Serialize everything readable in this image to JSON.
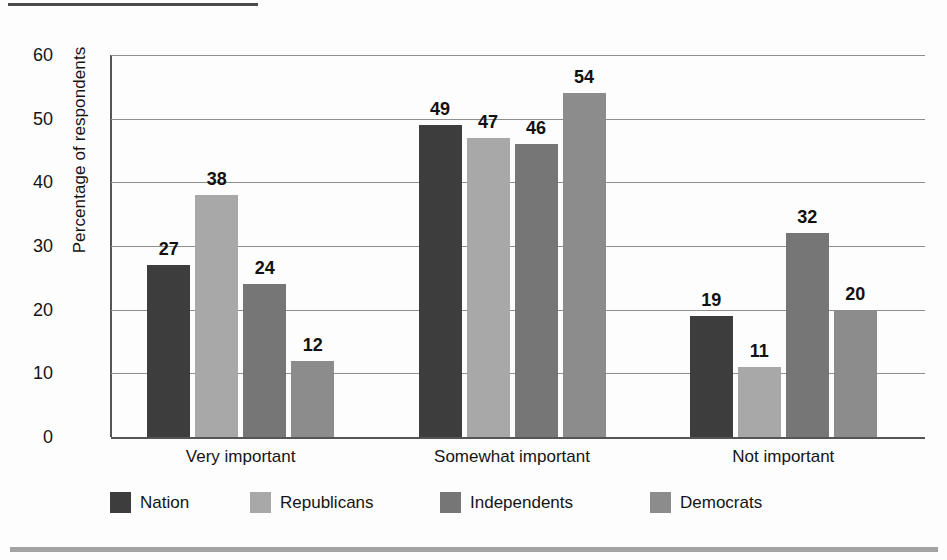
{
  "chart_data": {
    "type": "bar",
    "title": "",
    "subtitle": "",
    "xlabel": "",
    "ylabel": "Percentage of respondents",
    "ylim": [
      0,
      60
    ],
    "ytick_step": 10,
    "yticks": [
      "0",
      "10",
      "20",
      "30",
      "40",
      "50",
      "60"
    ],
    "grid": true,
    "grid_axis": "y",
    "legend_position": "bottom",
    "categories": [
      "Very important",
      "Somewhat important",
      "Not important"
    ],
    "series": [
      {
        "name": "Nation",
        "color": "#3d3d3d",
        "values": [
          27,
          49,
          19
        ]
      },
      {
        "name": "Republicans",
        "color": "#a8a8a8",
        "values": [
          38,
          47,
          11
        ]
      },
      {
        "name": "Independents",
        "color": "#767676",
        "values": [
          24,
          46,
          32
        ]
      },
      {
        "name": "Democrats",
        "color": "#8c8c8c",
        "values": [
          12,
          54,
          20
        ]
      }
    ],
    "data_labels": [
      [
        "27",
        "38",
        "24",
        "12"
      ],
      [
        "49",
        "47",
        "46",
        "54"
      ],
      [
        "19",
        "11",
        "32",
        "20"
      ]
    ]
  },
  "decor": {
    "rule_top_color": "#4a4a4a",
    "rule_bottom_color": "#a3a3a3",
    "background": "#fdfdfd"
  }
}
